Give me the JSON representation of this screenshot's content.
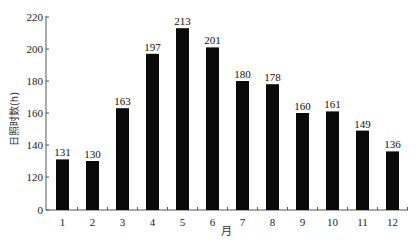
{
  "chart_data": {
    "type": "bar",
    "title": "",
    "xlabel": "月",
    "ylabel": "日照时数(h)",
    "categories": [
      "1",
      "2",
      "3",
      "4",
      "5",
      "6",
      "7",
      "8",
      "9",
      "10",
      "11",
      "12"
    ],
    "values": [
      131,
      130,
      163,
      197,
      213,
      201,
      180,
      178,
      160,
      161,
      149,
      136
    ],
    "series": [
      {
        "name": "日照时数",
        "values": [
          131,
          130,
          163,
          197,
          213,
          201,
          180,
          178,
          160,
          161,
          149,
          136
        ]
      }
    ],
    "yticks": [
      0,
      120,
      140,
      160,
      180,
      200,
      220
    ],
    "ylim": [
      0,
      220
    ],
    "y_axis_break": [
      0,
      120
    ],
    "grid": false,
    "legend": null,
    "bar_color": "#0a0a0a",
    "data_labels": true
  }
}
